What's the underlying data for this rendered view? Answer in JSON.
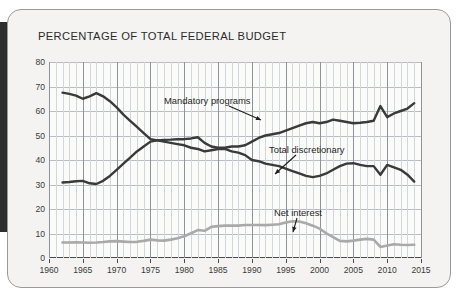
{
  "chart_data": {
    "type": "line",
    "title": "PERCENTAGE OF TOTAL FEDERAL BUDGET",
    "xlabel": "",
    "ylabel": "",
    "xlim": [
      1960,
      2015
    ],
    "ylim": [
      0,
      80
    ],
    "ytick_step": 10,
    "xtick_step": 5,
    "minor_x_step": 1,
    "grid": true,
    "legend": "inline-annotations",
    "yticks": [
      "0",
      "10",
      "20",
      "30",
      "40",
      "50",
      "60",
      "70",
      "80"
    ],
    "xticks": [
      "1960",
      "1965",
      "1970",
      "1975",
      "1980",
      "1985",
      "1990",
      "1995",
      "2000",
      "2005",
      "2010",
      "2015"
    ],
    "x": [
      1962,
      1963,
      1964,
      1965,
      1966,
      1967,
      1968,
      1969,
      1970,
      1971,
      1972,
      1973,
      1974,
      1975,
      1976,
      1977,
      1978,
      1979,
      1980,
      1981,
      1982,
      1983,
      1984,
      1985,
      1986,
      1987,
      1988,
      1989,
      1990,
      1991,
      1992,
      1993,
      1994,
      1995,
      1996,
      1997,
      1998,
      1999,
      2000,
      2001,
      2002,
      2003,
      2004,
      2005,
      2006,
      2007,
      2008,
      2009,
      2010,
      2011,
      2012,
      2013,
      2014
    ],
    "series": [
      {
        "name": "Total discretionary",
        "color": "#3a3a3a",
        "values": [
          67.5,
          67.0,
          66.3,
          65.0,
          66.0,
          67.3,
          66.0,
          64.0,
          61.5,
          58.5,
          56.0,
          53.5,
          51.0,
          48.5,
          48.0,
          47.5,
          47.0,
          46.5,
          46.0,
          45.0,
          44.5,
          43.5,
          44.0,
          44.5,
          44.5,
          43.5,
          43.0,
          42.0,
          40.0,
          39.5,
          38.5,
          38.0,
          37.5,
          36.5,
          35.5,
          34.5,
          33.5,
          33.0,
          33.5,
          34.5,
          36.0,
          37.5,
          38.5,
          38.7,
          38.0,
          37.5,
          37.5,
          34.0,
          38.0,
          37.0,
          36.0,
          34.0,
          31.2
        ]
      },
      {
        "name": "Mandatory programs",
        "color": "#3a3a3a",
        "values": [
          30.8,
          31.0,
          31.3,
          31.5,
          30.5,
          30.2,
          31.5,
          33.5,
          36.0,
          38.5,
          41.0,
          43.5,
          45.5,
          47.5,
          48.0,
          48.2,
          48.3,
          48.5,
          48.5,
          48.8,
          49.3,
          47.0,
          45.5,
          45.0,
          45.0,
          45.5,
          45.5,
          46.0,
          47.5,
          49.0,
          50.0,
          50.5,
          51.0,
          52.0,
          53.0,
          54.0,
          55.0,
          55.5,
          55.0,
          55.5,
          56.5,
          56.0,
          55.5,
          55.0,
          55.2,
          55.5,
          56.0,
          62.0,
          57.5,
          59.0,
          60.0,
          61.0,
          63.2
        ]
      },
      {
        "name": "Net interest",
        "color": "#a9a9a9",
        "values": [
          6.3,
          6.3,
          6.4,
          6.3,
          6.2,
          6.3,
          6.5,
          6.8,
          6.9,
          6.7,
          6.5,
          6.6,
          7.0,
          7.5,
          7.2,
          7.1,
          7.5,
          8.1,
          8.9,
          10.1,
          11.4,
          11.1,
          12.7,
          13.0,
          13.2,
          13.2,
          13.2,
          13.5,
          13.5,
          13.5,
          13.4,
          13.6,
          13.8,
          14.5,
          15.0,
          14.9,
          14.2,
          13.2,
          12.0,
          10.1,
          8.5,
          7.0,
          6.8,
          7.1,
          7.5,
          7.8,
          7.5,
          4.5,
          5.1,
          5.6,
          5.4,
          5.3,
          5.4
        ]
      }
    ],
    "annotations": [
      {
        "text": "Mandatory programs",
        "target_series": "Mandatory programs",
        "arrow": "down-right"
      },
      {
        "text": "Total discretionary",
        "target_series": "Total discretionary",
        "arrow": "down-left"
      },
      {
        "text": "Net interest",
        "target_series": "Net interest",
        "arrow": "down"
      }
    ]
  }
}
